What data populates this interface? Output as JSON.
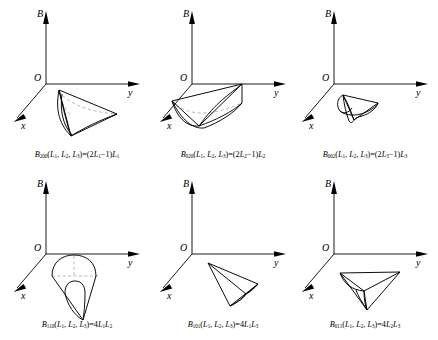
{
  "figure": {
    "kind": "math-figure",
    "panel_rows": 2,
    "panel_cols": 3,
    "line_color": "#000000",
    "hidden_line_color": "#9a9a9a",
    "background": "#ffffff"
  },
  "axes": {
    "vertical_label": "B",
    "horizontal_label": "y",
    "depth_label": "x",
    "origin_label": "O"
  },
  "panels": [
    {
      "id": "b200",
      "row": 0,
      "col": 0,
      "surface": "curved-fin",
      "has_hidden_edges": true,
      "caption": {
        "symbol": "B",
        "subscript": "200",
        "arguments": "(L1, L2, L3)",
        "equals": "=",
        "expression": "(2L1−1)L1",
        "full_text": "B200(L1, L2, L3)=(2L1−1)L1"
      }
    },
    {
      "id": "b020",
      "row": 0,
      "col": 1,
      "surface": "curved-fin",
      "has_hidden_edges": true,
      "caption": {
        "symbol": "B",
        "subscript": "020",
        "arguments": "(L1, L2, L3)",
        "equals": "=",
        "expression": "(2L2−1)L2",
        "full_text": "B020(L1, L2, L3)=(2L2−1)L2"
      }
    },
    {
      "id": "b002",
      "row": 0,
      "col": 2,
      "surface": "curved-fin",
      "has_hidden_edges": false,
      "caption": {
        "symbol": "B",
        "subscript": "002",
        "arguments": "(L1, L2, L3)",
        "equals": "=",
        "expression": "(2L3−1)L3",
        "full_text": "B002(L1, L2, L3)=(2L3−1)L3"
      }
    },
    {
      "id": "b110",
      "row": 1,
      "col": 0,
      "surface": "teardrop-dome",
      "has_hidden_edges": true,
      "caption": {
        "symbol": "B",
        "subscript": "110",
        "arguments": "(L1, L2, L3)",
        "equals": "=",
        "expression": "4L1L2",
        "full_text": "B110(L1, L2, L3)=4L1L2"
      }
    },
    {
      "id": "b101",
      "row": 1,
      "col": 1,
      "surface": "dart",
      "has_hidden_edges": false,
      "caption": {
        "symbol": "B",
        "subscript": "101",
        "arguments": "(L1, L2, L3)",
        "equals": "=",
        "expression": "4L1L3",
        "full_text": "B101(L1, L2, L3)=4L1L3"
      }
    },
    {
      "id": "b011",
      "row": 1,
      "col": 2,
      "surface": "dart-wide",
      "has_hidden_edges": false,
      "caption": {
        "symbol": "B",
        "subscript": "011",
        "arguments": "(L1, L2, L3)",
        "equals": "=",
        "expression": "4L2L3",
        "full_text": "B011(L1, L2, L3)=4L2L3"
      }
    }
  ]
}
